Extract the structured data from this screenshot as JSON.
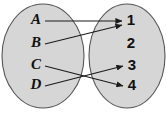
{
  "figure": {
    "type": "mapping-diagram",
    "background_color": "#ffffff",
    "ellipse_fill": "#d6d6d6",
    "ellipse_stroke": "#555555",
    "arrow_color": "#1a1a1a",
    "label_color": "#111111"
  },
  "domain_set": {
    "name": "domain-ellipse",
    "cx": 43,
    "cy": 56,
    "rx": 41,
    "ry": 52,
    "elements": [
      {
        "label": "A",
        "x": 36,
        "y": 21
      },
      {
        "label": "B",
        "x": 36,
        "y": 44
      },
      {
        "label": "C",
        "x": 36,
        "y": 66
      },
      {
        "label": "D",
        "x": 36,
        "y": 86
      }
    ]
  },
  "codomain_set": {
    "name": "codomain-ellipse",
    "cx": 127,
    "cy": 56,
    "rx": 38,
    "ry": 52,
    "elements": [
      {
        "label": "1",
        "x": 131,
        "y": 21
      },
      {
        "label": "2",
        "x": 131,
        "y": 44
      },
      {
        "label": "3",
        "x": 132,
        "y": 66
      },
      {
        "label": "4",
        "x": 132,
        "y": 86
      }
    ]
  },
  "mappings": [
    {
      "from": "A",
      "to": "1",
      "x1": 45,
      "y1": 21,
      "x2": 122,
      "y2": 21
    },
    {
      "from": "B",
      "to": "1",
      "x1": 45,
      "y1": 44,
      "x2": 122,
      "y2": 25
    },
    {
      "from": "C",
      "to": "4",
      "x1": 45,
      "y1": 66,
      "x2": 123,
      "y2": 86
    },
    {
      "from": "D",
      "to": "3",
      "x1": 45,
      "y1": 86,
      "x2": 123,
      "y2": 66
    }
  ]
}
